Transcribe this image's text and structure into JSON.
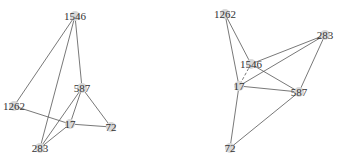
{
  "diagram": {
    "type": "network-graph-pair",
    "graphs": [
      {
        "id": "left",
        "nodes": [
          {
            "label": "1546",
            "x": 75,
            "y": 16
          },
          {
            "label": "587",
            "x": 82,
            "y": 88
          },
          {
            "label": "1262",
            "x": 14,
            "y": 106
          },
          {
            "label": "17",
            "x": 70,
            "y": 124
          },
          {
            "label": "72",
            "x": 111,
            "y": 127
          },
          {
            "label": "283",
            "x": 40,
            "y": 148
          }
        ],
        "edges": [
          [
            "1546",
            "1262"
          ],
          [
            "1546",
            "283"
          ],
          [
            "1546",
            "587"
          ],
          [
            "587",
            "17"
          ],
          [
            "587",
            "72"
          ],
          [
            "587",
            "283"
          ],
          [
            "1262",
            "17"
          ],
          [
            "17",
            "72"
          ],
          [
            "17",
            "283"
          ]
        ]
      },
      {
        "id": "right",
        "nodes": [
          {
            "label": "1262",
            "x": 225,
            "y": 14
          },
          {
            "label": "283",
            "x": 325,
            "y": 35
          },
          {
            "label": "1546",
            "x": 251,
            "y": 64
          },
          {
            "label": "17",
            "x": 239,
            "y": 86
          },
          {
            "label": "587",
            "x": 299,
            "y": 92
          },
          {
            "label": "72",
            "x": 230,
            "y": 148
          }
        ],
        "edges": [
          [
            "1262",
            "17"
          ],
          [
            "1262",
            "1546"
          ],
          [
            "1546",
            "283"
          ],
          [
            "1546",
            "587"
          ],
          [
            "17",
            "283"
          ],
          [
            "17",
            "587"
          ],
          [
            "283",
            "587"
          ],
          [
            "17",
            "72"
          ],
          [
            "72",
            "587"
          ]
        ],
        "dashed_edges": [
          [
            "1546",
            "17"
          ]
        ]
      }
    ]
  }
}
